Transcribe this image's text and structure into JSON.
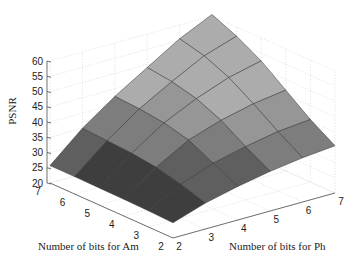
{
  "chart_data": {
    "type": "surface",
    "title": "",
    "xlabel": "Number of bits for Ph",
    "ylabel": "Number of bits for Am",
    "zlabel": "PSNR",
    "x_ticks": [
      2,
      3,
      4,
      5,
      6,
      7
    ],
    "y_ticks": [
      2,
      3,
      4,
      5,
      6,
      7
    ],
    "z_ticks": [
      20,
      25,
      30,
      35,
      40,
      45,
      50,
      55,
      60
    ],
    "zlim": [
      20,
      60
    ],
    "grid": true,
    "x": [
      2,
      3,
      4,
      5,
      6,
      7
    ],
    "y": [
      2,
      3,
      4,
      5,
      6,
      7
    ],
    "z": [
      [
        25.0,
        28.5,
        31.0,
        33.0,
        34.5,
        35.5
      ],
      [
        25.3,
        31.0,
        35.0,
        37.5,
        39.5,
        40.5
      ],
      [
        25.5,
        33.0,
        39.0,
        42.5,
        45.0,
        46.5
      ],
      [
        25.6,
        34.0,
        41.0,
        46.0,
        50.0,
        52.5
      ],
      [
        25.7,
        34.5,
        42.0,
        48.0,
        53.5,
        57.0
      ],
      [
        25.7,
        35.0,
        42.5,
        49.0,
        55.5,
        60.5
      ]
    ]
  },
  "labels": {
    "zlabel": "PSNR",
    "am_label": "Number of bits for Am",
    "ph_label": "Number of bits for Ph"
  }
}
